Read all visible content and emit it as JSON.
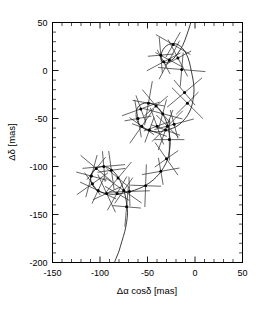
{
  "figure": {
    "background": "#ffffff",
    "ink_color": "#000000",
    "curve_color": "#1a1a1a",
    "errorbar_color": "#333333"
  },
  "chart_data": {
    "type": "scatter",
    "title": "",
    "subtitle": "",
    "xlabel": "Δα cosδ  [mas]",
    "ylabel": "Δδ  [mas]",
    "xlim": [
      -150,
      50
    ],
    "ylim": [
      -200,
      50
    ],
    "grid": false,
    "legend": null,
    "xticks": [
      -150,
      -100,
      -50,
      0,
      50
    ],
    "xtick_labels": [
      "-150",
      "-100",
      "-50",
      "0",
      "50"
    ],
    "yticks": [
      50,
      0,
      -50,
      -100,
      -150,
      -200
    ],
    "ytick_labels": [
      "50",
      "0",
      "-50",
      "-100",
      "-150",
      "-200"
    ],
    "minor_tick_divisions": 5,
    "tick_direction": "in",
    "axis_units": "mas",
    "series": [
      {
        "name": "model trajectory",
        "type": "line",
        "description": "parallax loops superposed on proper motion plus orbital motion",
        "points": [
          [
            -2,
            60
          ],
          [
            -5,
            48
          ],
          [
            -9,
            36
          ],
          [
            -13,
            26
          ],
          [
            -18,
            18
          ],
          [
            -23,
            12
          ],
          [
            -28,
            9
          ],
          [
            -32,
            8
          ],
          [
            -35,
            10
          ],
          [
            -36,
            14
          ],
          [
            -35,
            19
          ],
          [
            -32,
            24
          ],
          [
            -28,
            27
          ],
          [
            -23,
            28
          ],
          [
            -18,
            27
          ],
          [
            -13,
            23
          ],
          [
            -9,
            17
          ],
          [
            -6,
            9
          ],
          [
            -4,
            0
          ],
          [
            -2,
            -10
          ],
          [
            -1,
            -20
          ],
          [
            -2,
            -30
          ],
          [
            -4,
            -39
          ],
          [
            -8,
            -47
          ],
          [
            -13,
            -53
          ],
          [
            -19,
            -58
          ],
          [
            -26,
            -61
          ],
          [
            -33,
            -63
          ],
          [
            -40,
            -64
          ],
          [
            -47,
            -63
          ],
          [
            -53,
            -61
          ],
          [
            -58,
            -57
          ],
          [
            -61,
            -52
          ],
          [
            -62,
            -46
          ],
          [
            -61,
            -40
          ],
          [
            -58,
            -36
          ],
          [
            -53,
            -34
          ],
          [
            -47,
            -34
          ],
          [
            -41,
            -37
          ],
          [
            -36,
            -42
          ],
          [
            -32,
            -49
          ],
          [
            -29,
            -57
          ],
          [
            -27,
            -66
          ],
          [
            -26,
            -75
          ],
          [
            -27,
            -84
          ],
          [
            -29,
            -93
          ],
          [
            -33,
            -101
          ],
          [
            -38,
            -108
          ],
          [
            -44,
            -114
          ],
          [
            -51,
            -119
          ],
          [
            -59,
            -123
          ],
          [
            -68,
            -126
          ],
          [
            -77,
            -128
          ],
          [
            -86,
            -129
          ],
          [
            -94,
            -128
          ],
          [
            -101,
            -126
          ],
          [
            -106,
            -122
          ],
          [
            -109,
            -117
          ],
          [
            -110,
            -111
          ],
          [
            -108,
            -106
          ],
          [
            -104,
            -102
          ],
          [
            -98,
            -100
          ],
          [
            -92,
            -101
          ],
          [
            -86,
            -105
          ],
          [
            -81,
            -111
          ],
          [
            -77,
            -119
          ],
          [
            -74,
            -128
          ],
          [
            -72,
            -138
          ],
          [
            -71,
            -148
          ],
          [
            -72,
            -158
          ],
          [
            -74,
            -168
          ],
          [
            -77,
            -178
          ],
          [
            -80,
            -188
          ],
          [
            -84,
            -198
          ],
          [
            -86,
            -204
          ]
        ]
      },
      {
        "name": "observations",
        "type": "scatter_with_errorbars",
        "marker": "filled-circle",
        "points": [
          {
            "x": -27,
            "y": 11,
            "err": 46,
            "angle": 62
          },
          {
            "x": -18,
            "y": 13,
            "err": 44,
            "angle": 118
          },
          {
            "x": -33,
            "y": 9,
            "err": 40,
            "angle": 28
          },
          {
            "x": -36,
            "y": 16,
            "err": 38,
            "angle": 95
          },
          {
            "x": -23,
            "y": 27,
            "err": 42,
            "angle": 150
          },
          {
            "x": -14,
            "y": 1,
            "err": 50,
            "angle": 175
          },
          {
            "x": -11,
            "y": -23,
            "err": 48,
            "angle": 40
          },
          {
            "x": -8,
            "y": -34,
            "err": 46,
            "angle": 135
          },
          {
            "x": -22,
            "y": -56,
            "err": 43,
            "angle": 15
          },
          {
            "x": -31,
            "y": -62,
            "err": 45,
            "angle": 70
          },
          {
            "x": -40,
            "y": -58,
            "err": 41,
            "angle": 110
          },
          {
            "x": -48,
            "y": -62,
            "err": 39,
            "angle": 160
          },
          {
            "x": -56,
            "y": -58,
            "err": 44,
            "angle": 55
          },
          {
            "x": -60,
            "y": -50,
            "err": 40,
            "angle": 100
          },
          {
            "x": -57,
            "y": -40,
            "err": 42,
            "angle": 20
          },
          {
            "x": -49,
            "y": -34,
            "err": 47,
            "angle": 80
          },
          {
            "x": -41,
            "y": -37,
            "err": 45,
            "angle": 130
          },
          {
            "x": -34,
            "y": -45,
            "err": 43,
            "angle": 165
          },
          {
            "x": -29,
            "y": -58,
            "err": 46,
            "angle": 45
          },
          {
            "x": -27,
            "y": -72,
            "err": 44,
            "angle": 90
          },
          {
            "x": -30,
            "y": -92,
            "err": 42,
            "angle": 125
          },
          {
            "x": -36,
            "y": -105,
            "err": 40,
            "angle": 10
          },
          {
            "x": -52,
            "y": -120,
            "err": 45,
            "angle": 88
          },
          {
            "x": -69,
            "y": -126,
            "err": 43,
            "angle": 2
          },
          {
            "x": -82,
            "y": -128,
            "err": 41,
            "angle": 60
          },
          {
            "x": -93,
            "y": -128,
            "err": 44,
            "angle": 115
          },
          {
            "x": -102,
            "y": -125,
            "err": 42,
            "angle": 155
          },
          {
            "x": -108,
            "y": -118,
            "err": 40,
            "angle": 35
          },
          {
            "x": -109,
            "y": -110,
            "err": 46,
            "angle": 75
          },
          {
            "x": -104,
            "y": -102,
            "err": 43,
            "angle": 140
          },
          {
            "x": -96,
            "y": -100,
            "err": 45,
            "angle": 5
          },
          {
            "x": -88,
            "y": -104,
            "err": 41,
            "angle": 98
          },
          {
            "x": -81,
            "y": -112,
            "err": 44,
            "angle": 50
          },
          {
            "x": -75,
            "y": -125,
            "err": 46,
            "angle": 145
          },
          {
            "x": -72,
            "y": -142,
            "err": 42,
            "angle": 85
          }
        ]
      }
    ]
  }
}
